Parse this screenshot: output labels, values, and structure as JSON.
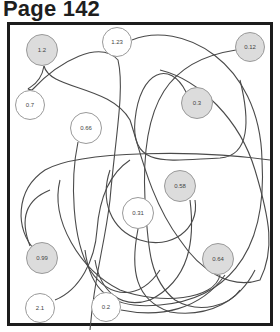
{
  "page": {
    "title": "Page 142"
  },
  "colors": {
    "border": "#1c1c1c",
    "curve": "#4a4a4a",
    "node_stroke": "#9a9a9a",
    "node_fill": "#dcdcdc"
  },
  "nodes": [
    {
      "label": "1.2",
      "filled": true,
      "x": 42,
      "y": 50,
      "r": 16
    },
    {
      "label": "1.23",
      "filled": false,
      "x": 117,
      "y": 42,
      "r": 15
    },
    {
      "label": "0.12",
      "filled": true,
      "x": 250,
      "y": 47,
      "r": 15
    },
    {
      "label": "0.7",
      "filled": false,
      "x": 30,
      "y": 105,
      "r": 15
    },
    {
      "label": "0.3",
      "filled": true,
      "x": 197,
      "y": 103,
      "r": 16
    },
    {
      "label": "0.66",
      "filled": false,
      "x": 86,
      "y": 128,
      "r": 16
    },
    {
      "label": "0.58",
      "filled": true,
      "x": 180,
      "y": 186,
      "r": 16
    },
    {
      "label": "0.31",
      "filled": false,
      "x": 138,
      "y": 213,
      "r": 16
    },
    {
      "label": "0.99",
      "filled": true,
      "x": 42,
      "y": 258,
      "r": 16
    },
    {
      "label": "0.64",
      "filled": true,
      "x": 218,
      "y": 259,
      "r": 16
    },
    {
      "label": "2.1",
      "filled": false,
      "x": 40,
      "y": 308,
      "r": 15
    },
    {
      "label": "0.2",
      "filled": false,
      "x": 106,
      "y": 307,
      "r": 15
    }
  ]
}
